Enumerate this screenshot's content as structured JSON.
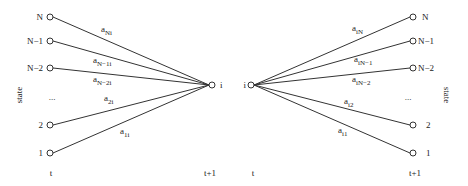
{
  "diagram": {
    "left_panel": {
      "axis_label": "state",
      "time_from": "t",
      "time_to": "t+1",
      "target_label": "i",
      "ellipsis": "...",
      "states": [
        {
          "label": "N",
          "edge_base": "a",
          "edge_sub": "Ni"
        },
        {
          "label": "N−1",
          "edge_base": "a",
          "edge_sub": "N−1i"
        },
        {
          "label": "N−2",
          "edge_base": "a",
          "edge_sub": "N−2i"
        },
        {
          "label": "2",
          "edge_base": "a",
          "edge_sub": "2i"
        },
        {
          "label": "1",
          "edge_base": "a",
          "edge_sub": "1i"
        }
      ]
    },
    "right_panel": {
      "axis_label": "state",
      "time_from": "t",
      "time_to": "t+1",
      "source_label": "i",
      "ellipsis": "...",
      "states": [
        {
          "label": "N",
          "edge_base": "a",
          "edge_sub": "iN"
        },
        {
          "label": "N−1",
          "edge_base": "a",
          "edge_sub": "iN−1"
        },
        {
          "label": "N−2",
          "edge_base": "a",
          "edge_sub": "iN−2"
        },
        {
          "label": "2",
          "edge_base": "a",
          "edge_sub": "i2"
        },
        {
          "label": "1",
          "edge_base": "a",
          "edge_sub": "i1"
        }
      ]
    }
  }
}
